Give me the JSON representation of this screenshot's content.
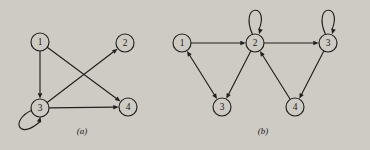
{
  "figure": {
    "background_color": "#cdcbc4",
    "ink_color": "#22201e",
    "panels": [
      {
        "id": "panel-a",
        "caption": "(a)",
        "caption_x": 82,
        "caption_y": 134,
        "nodes": [
          {
            "id": "a1",
            "label": "1",
            "cx": 40,
            "cy": 42,
            "r": 9
          },
          {
            "id": "a2",
            "label": "2",
            "cx": 125,
            "cy": 43,
            "r": 9
          },
          {
            "id": "a3",
            "label": "3",
            "cx": 40,
            "cy": 108,
            "r": 9
          },
          {
            "id": "a4",
            "label": "4",
            "cx": 128,
            "cy": 107,
            "r": 9
          }
        ],
        "edges": [
          {
            "from": "a1",
            "to": "a3",
            "kind": "straight",
            "arrow": "forward"
          },
          {
            "from": "a1",
            "to": "a4",
            "kind": "straight",
            "arrow": "forward"
          },
          {
            "from": "a3",
            "to": "a2",
            "kind": "straight",
            "arrow": "forward"
          },
          {
            "from": "a3",
            "to": "a4",
            "kind": "straight",
            "arrow": "forward"
          },
          {
            "from": "a3",
            "to": "a3",
            "kind": "self-loop",
            "arrow": "forward",
            "loop_direction": "down-left"
          }
        ]
      },
      {
        "id": "panel-b",
        "caption": "(b)",
        "caption_x": 263,
        "caption_y": 134,
        "nodes": [
          {
            "id": "b1",
            "label": "1",
            "cx": 182,
            "cy": 43,
            "r": 9
          },
          {
            "id": "b2",
            "label": "2",
            "cx": 255,
            "cy": 43,
            "r": 9
          },
          {
            "id": "b3r",
            "label": "3",
            "cx": 328,
            "cy": 43,
            "r": 9
          },
          {
            "id": "b3b",
            "label": "3",
            "cx": 222,
            "cy": 107,
            "r": 9
          },
          {
            "id": "b4",
            "label": "4",
            "cx": 295,
            "cy": 107,
            "r": 9
          }
        ],
        "edges": [
          {
            "from": "b1",
            "to": "b2",
            "kind": "straight",
            "arrow": "forward"
          },
          {
            "from": "b1",
            "to": "b3b",
            "kind": "straight",
            "arrow": "both"
          },
          {
            "from": "b2",
            "to": "b3b",
            "kind": "straight",
            "arrow": "forward"
          },
          {
            "from": "b2",
            "to": "b3r",
            "kind": "straight",
            "arrow": "forward"
          },
          {
            "from": "b2",
            "to": "b2",
            "kind": "self-loop",
            "arrow": "forward",
            "loop_direction": "up"
          },
          {
            "from": "b3r",
            "to": "b4",
            "kind": "straight",
            "arrow": "forward"
          },
          {
            "from": "b3r",
            "to": "b3r",
            "kind": "self-loop",
            "arrow": "forward",
            "loop_direction": "up"
          },
          {
            "from": "b4",
            "to": "b2",
            "kind": "straight",
            "arrow": "forward"
          }
        ]
      }
    ]
  }
}
